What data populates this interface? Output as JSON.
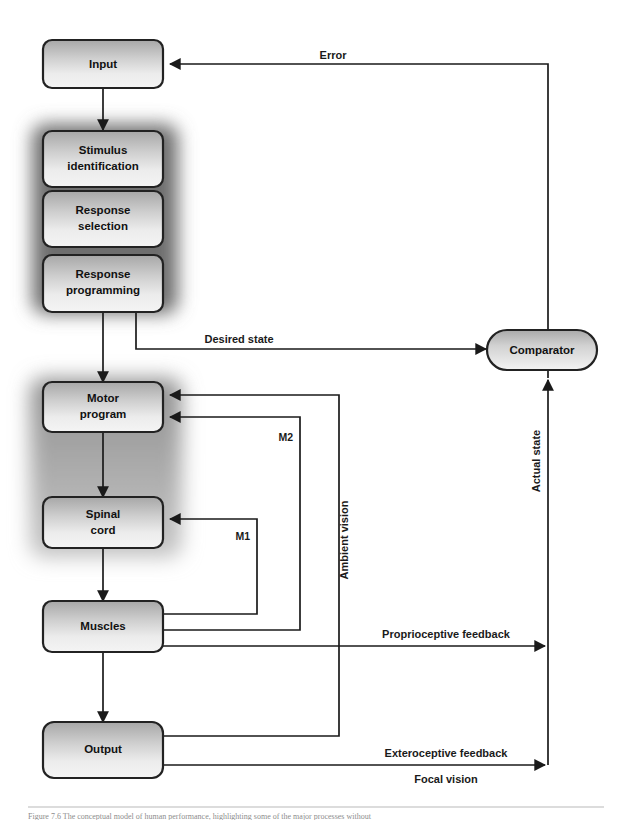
{
  "figure": {
    "title_alt": "Conceptual model of human performance",
    "caption": "Figure  7.6   The conceptual model of human performance, highlighting some of the major processes without",
    "background_color": "#ffffff",
    "line_color": "#1a1a1a",
    "box_fill_top": "#aaaaaa",
    "box_fill_bottom": "#f2f2f2",
    "box_stroke": "#222222",
    "glow_color": "#7d7d7d",
    "shade_color": "#9a9a9a"
  },
  "nodes": [
    {
      "id": "input",
      "label": "Input",
      "shape": "rounded-rect"
    },
    {
      "id": "stimulus_identification",
      "label_line1": "Stimulus",
      "label_line2": "identification",
      "shape": "rounded-rect"
    },
    {
      "id": "response_selection",
      "label_line1": "Response",
      "label_line2": "selection",
      "shape": "rounded-rect"
    },
    {
      "id": "response_programming",
      "label_line1": "Response",
      "label_line2": "programming",
      "shape": "rounded-rect"
    },
    {
      "id": "motor_program",
      "label_line1": "Motor",
      "label_line2": "program",
      "shape": "rounded-rect"
    },
    {
      "id": "spinal_cord",
      "label_line1": "Spinal",
      "label_line2": "cord",
      "shape": "rounded-rect"
    },
    {
      "id": "muscles",
      "label": "Muscles",
      "shape": "rounded-rect"
    },
    {
      "id": "output",
      "label": "Output",
      "shape": "rounded-rect"
    },
    {
      "id": "comparator",
      "label": "Comparator",
      "shape": "pill"
    }
  ],
  "edge_labels": {
    "error": "Error",
    "desired_state": "Desired state",
    "actual_state": "Actual state",
    "ambient_vision": "Ambient vision",
    "proprioceptive_feedback": "Proprioceptive feedback",
    "exteroceptive_feedback": "Exteroceptive feedback",
    "focal_vision": "Focal vision",
    "m1": "M1",
    "m2": "M2"
  }
}
